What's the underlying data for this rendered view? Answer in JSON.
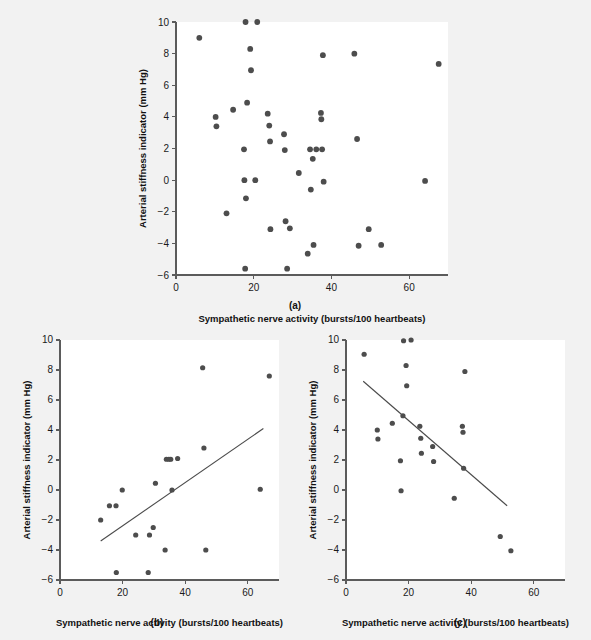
{
  "figure": {
    "background_color": "#f2f2f2",
    "plot_background_color": "#ffffff",
    "point_color": "#4d4d4d",
    "line_color": "#4a4a4a",
    "axis_color": "#5b5b5b"
  },
  "panels": {
    "a": {
      "caption": "(a)"
    },
    "b": {
      "caption": "(b)"
    },
    "c": {
      "caption": "(c)"
    }
  },
  "chart_data": [
    {
      "type": "scatter",
      "panel": "a",
      "title": "",
      "xlabel": "Sympathetic nerve activity (bursts/100 heartbeats)",
      "ylabel": "Arterial stiffness indicator (mm Hg)",
      "xlim": [
        0,
        70
      ],
      "ylim": [
        -6,
        10
      ],
      "xticks": [
        0,
        20,
        40,
        60
      ],
      "yticks": [
        -6,
        -4,
        -2,
        0,
        2,
        4,
        6,
        8,
        10
      ],
      "xtick_labels": [
        "0",
        "20",
        "40",
        "60"
      ],
      "ytick_labels": [
        "-6",
        "-4",
        "-2",
        "0",
        "2",
        "4",
        "6",
        "8",
        "10"
      ],
      "grid": false,
      "legend": null,
      "trendline": null,
      "points": [
        [
          6.0,
          9.0
        ],
        [
          10.2,
          4.0
        ],
        [
          10.4,
          3.4
        ],
        [
          13.0,
          -2.1
        ],
        [
          14.7,
          4.45
        ],
        [
          17.5,
          1.95
        ],
        [
          17.6,
          0.0
        ],
        [
          17.8,
          -5.6
        ],
        [
          17.9,
          10.0
        ],
        [
          18.0,
          -1.15
        ],
        [
          18.3,
          4.9
        ],
        [
          19.1,
          8.3
        ],
        [
          19.3,
          6.95
        ],
        [
          20.4,
          0.0
        ],
        [
          20.9,
          10.0
        ],
        [
          23.6,
          4.2
        ],
        [
          24.0,
          3.45
        ],
        [
          24.2,
          2.45
        ],
        [
          24.3,
          -3.1
        ],
        [
          27.8,
          2.9
        ],
        [
          28.0,
          1.9
        ],
        [
          28.2,
          -2.6
        ],
        [
          28.6,
          -5.6
        ],
        [
          29.3,
          -3.05
        ],
        [
          31.6,
          0.45
        ],
        [
          33.9,
          -4.65
        ],
        [
          34.5,
          1.95
        ],
        [
          34.7,
          -0.6
        ],
        [
          35.2,
          1.35
        ],
        [
          35.4,
          -4.1
        ],
        [
          36.1,
          1.95
        ],
        [
          37.3,
          4.25
        ],
        [
          37.4,
          3.85
        ],
        [
          37.6,
          1.95
        ],
        [
          37.8,
          7.9
        ],
        [
          38.0,
          -0.1
        ],
        [
          45.9,
          8.0
        ],
        [
          46.6,
          2.6
        ],
        [
          47.0,
          -4.15
        ],
        [
          49.6,
          -3.1
        ],
        [
          52.8,
          -4.1
        ],
        [
          64.1,
          -0.05
        ],
        [
          67.6,
          7.35
        ]
      ]
    },
    {
      "type": "scatter",
      "panel": "b",
      "title": "",
      "xlabel": "Sympathetic nerve activity (bursts/100 heartbeats)",
      "ylabel": "Arterial stiffness indicator (mm Hg)",
      "xlim": [
        0,
        70
      ],
      "ylim": [
        -6,
        10
      ],
      "xticks": [
        0,
        20,
        40,
        60
      ],
      "yticks": [
        -6,
        -4,
        -2,
        0,
        2,
        4,
        6,
        8,
        10
      ],
      "xtick_labels": [
        "0",
        "20",
        "40",
        "60"
      ],
      "ytick_labels": [
        "-6",
        "-4",
        "-2",
        "0",
        "2",
        "4",
        "6",
        "8",
        "10"
      ],
      "grid": false,
      "legend": null,
      "trendline": {
        "x1": 13.0,
        "y1": -3.4,
        "x2": 65.0,
        "y2": 4.1
      },
      "points": [
        [
          13.0,
          -2.0
        ],
        [
          15.8,
          -1.05
        ],
        [
          17.9,
          -1.05
        ],
        [
          18.0,
          -5.5
        ],
        [
          19.9,
          0.0
        ],
        [
          24.2,
          -3.0
        ],
        [
          28.2,
          -5.5
        ],
        [
          28.6,
          -3.0
        ],
        [
          29.8,
          -2.5
        ],
        [
          30.5,
          0.45
        ],
        [
          33.6,
          -4.0
        ],
        [
          34.0,
          2.05
        ],
        [
          34.8,
          2.05
        ],
        [
          35.4,
          2.05
        ],
        [
          35.8,
          0.0
        ],
        [
          37.6,
          2.1
        ],
        [
          45.6,
          8.15
        ],
        [
          46.0,
          2.8
        ],
        [
          46.6,
          -4.0
        ],
        [
          64.0,
          0.05
        ],
        [
          66.9,
          7.6
        ]
      ]
    },
    {
      "type": "scatter",
      "panel": "c",
      "title": "",
      "xlabel": "Sympathetic nerve activity (bursts/100 heartbeats)",
      "ylabel": "Arterial stiffness indicator (mm Hg)",
      "xlim": [
        0,
        70
      ],
      "ylim": [
        -6,
        10
      ],
      "xticks": [
        0,
        20,
        40,
        60
      ],
      "yticks": [
        -6,
        -4,
        -2,
        0,
        2,
        4,
        6,
        8,
        10
      ],
      "xtick_labels": [
        "0",
        "20",
        "40",
        "60"
      ],
      "ytick_labels": [
        "-6",
        "-4",
        "-2",
        "0",
        "2",
        "4",
        "6",
        "8",
        "10"
      ],
      "grid": false,
      "legend": null,
      "trendline": {
        "x1": 5.5,
        "y1": 7.25,
        "x2": 51.5,
        "y2": -1.05
      },
      "points": [
        [
          5.8,
          9.05
        ],
        [
          10.0,
          4.0
        ],
        [
          10.2,
          3.4
        ],
        [
          14.8,
          4.45
        ],
        [
          17.4,
          1.95
        ],
        [
          17.6,
          -0.05
        ],
        [
          18.2,
          4.95
        ],
        [
          18.4,
          9.95
        ],
        [
          19.2,
          8.3
        ],
        [
          19.4,
          6.95
        ],
        [
          20.8,
          10.0
        ],
        [
          23.6,
          4.25
        ],
        [
          23.9,
          3.45
        ],
        [
          24.1,
          2.45
        ],
        [
          27.7,
          2.9
        ],
        [
          28.0,
          1.9
        ],
        [
          34.6,
          -0.55
        ],
        [
          37.2,
          4.25
        ],
        [
          37.4,
          3.85
        ],
        [
          37.6,
          1.45
        ],
        [
          38.0,
          7.9
        ],
        [
          49.3,
          -3.1
        ],
        [
          52.7,
          -4.05
        ]
      ]
    }
  ]
}
